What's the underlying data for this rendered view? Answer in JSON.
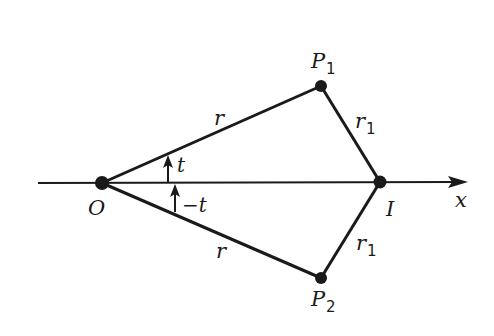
{
  "diagram": {
    "axis_label": "x",
    "points": {
      "O": {
        "label": "O",
        "x": 102,
        "y": 183
      },
      "I": {
        "label": "I",
        "x": 380,
        "y": 182
      },
      "P1": {
        "label": "P",
        "sub": "1",
        "x": 321,
        "y": 86
      },
      "P2": {
        "label": "P",
        "sub": "2",
        "x": 321,
        "y": 278
      }
    },
    "edges": {
      "O_P1": {
        "label": "r"
      },
      "O_P2": {
        "label": "r"
      },
      "P1_I": {
        "label": "r",
        "sub": "1"
      },
      "P2_I": {
        "label": "r",
        "sub": "1"
      }
    },
    "angles": {
      "upper": {
        "label": "t"
      },
      "lower": {
        "label": "−t"
      }
    },
    "colors": {
      "ink": "#1a1a1a",
      "background": "#ffffff"
    }
  }
}
